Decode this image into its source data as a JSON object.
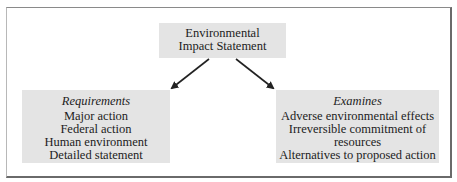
{
  "diagram": {
    "title_box": {
      "lines": [
        "Environmental",
        "Impact Statement"
      ]
    },
    "left_box": {
      "heading": "Requirements",
      "items": [
        "Major action",
        "Federal action",
        "Human environment",
        "Detailed statement"
      ]
    },
    "right_box": {
      "heading": "Examines",
      "items": [
        "Adverse environmental effects",
        "Irreversible commitment of",
        "resources",
        "Alternatives to proposed action"
      ]
    },
    "arrows": [
      {
        "from": "title_box",
        "to": "left_box"
      },
      {
        "from": "title_box",
        "to": "right_box"
      }
    ],
    "colors": {
      "box_fill": "#e4e4e4",
      "frame_border": "#6a6a6a",
      "arrow": "#222222",
      "text": "#1c1c1c"
    }
  }
}
